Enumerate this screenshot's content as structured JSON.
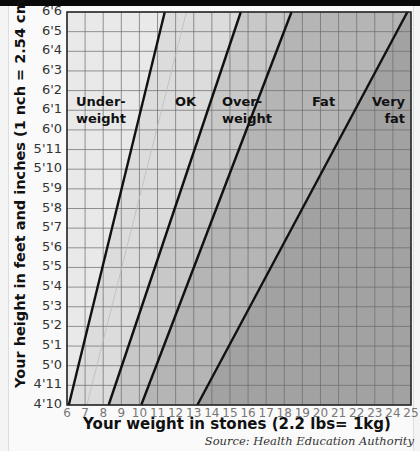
{
  "chart_data": {
    "type": "line",
    "title": "",
    "xlabel": "Your weight in stones (2.2 lbs= 1kg)",
    "ylabel": "Your height in feet and inches (1 nch = 2.54 cm)",
    "xlim": [
      6,
      25
    ],
    "ylim": [
      "4'10",
      "6'6"
    ],
    "grid": true,
    "x_ticks": [
      "6",
      "7",
      "8",
      "9",
      "10",
      "11",
      "12",
      "13",
      "14",
      "15",
      "16",
      "17",
      "18",
      "19",
      "20",
      "21",
      "22",
      "23",
      "24",
      "25"
    ],
    "y_ticks": [
      "6'6",
      "6'5",
      "6'4",
      "6'3",
      "6'2",
      "6'1",
      "6'0",
      "5'11",
      "5'10",
      "5'9",
      "5'8",
      "5'7",
      "5'6",
      "5'5",
      "5'4",
      "5'3",
      "5'2",
      "5'1",
      "5'0",
      "4'11",
      "4'10"
    ],
    "zones": [
      {
        "name": "Under-weight",
        "label_lines": [
          "Under-",
          "weight"
        ],
        "shade": "#e9e9e9"
      },
      {
        "name": "OK",
        "label_lines": [
          "OK"
        ],
        "shade": "#dcdcdc"
      },
      {
        "name": "Over-weight",
        "label_lines": [
          "Over-",
          "weight"
        ],
        "shade": "#c8c8c8"
      },
      {
        "name": "Fat",
        "label_lines": [
          "Fat"
        ],
        "shade": "#b5b5b5"
      },
      {
        "name": "Very fat",
        "label_lines": [
          "Very",
          "fat"
        ],
        "shade": "#a2a2a2"
      }
    ],
    "series": [
      {
        "name": "Under-weight / OK boundary",
        "points": [
          {
            "x": 6.1,
            "y": "4'10"
          },
          {
            "x": 11.4,
            "y": "6'6"
          }
        ]
      },
      {
        "name": "OK / Over-weight boundary",
        "points": [
          {
            "x": 8.3,
            "y": "4'10"
          },
          {
            "x": 15.6,
            "y": "6'6"
          }
        ]
      },
      {
        "name": "Over-weight / Fat boundary",
        "points": [
          {
            "x": 10.1,
            "y": "4'10"
          },
          {
            "x": 18.4,
            "y": "6'6"
          }
        ]
      },
      {
        "name": "Fat / Very fat boundary",
        "points": [
          {
            "x": 13.2,
            "y": "4'10"
          },
          {
            "x": 24.8,
            "y": "6'6"
          }
        ]
      }
    ],
    "source": "Source: Health Education Authority"
  }
}
